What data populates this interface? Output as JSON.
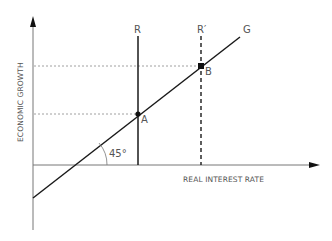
{
  "diagram": {
    "axes": {
      "y_label": "ECONOMIC GROWTH",
      "x_label": "REAL INTEREST RATE"
    },
    "curves": {
      "G": "G",
      "R": "R",
      "R_prime": "R′"
    },
    "points": {
      "A": "A",
      "B": "B"
    },
    "angle": "45°",
    "colors": {
      "axis": "#777777",
      "line": "#1a1a1a",
      "guide": "#888888",
      "text": "#555555"
    }
  }
}
